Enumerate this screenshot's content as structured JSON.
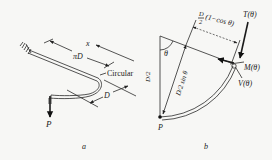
{
  "figure": {
    "panel_a": {
      "caption": "a",
      "labels": {
        "x": "x",
        "pi_d": "πD",
        "circular": "Circular",
        "d": "D",
        "p": "P"
      }
    },
    "panel_b": {
      "caption": "b",
      "labels": {
        "d_over_2_frac_num": "D",
        "d_over_2_frac_den": "2",
        "one_minus_cos": "(1−cos θ)",
        "torque": "T(θ)",
        "moment": "M(θ)",
        "shear": "V(θ)",
        "theta": "θ",
        "radius": "D/2",
        "sin_term": "D/2 sin θ",
        "p": "P"
      }
    }
  }
}
